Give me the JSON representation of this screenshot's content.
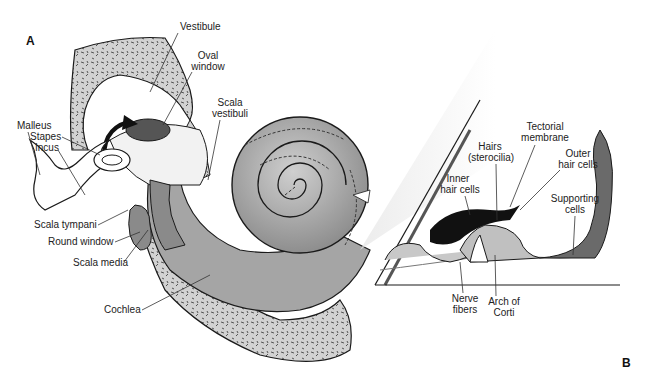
{
  "figure": {
    "panels": {
      "a": "A",
      "b": "B"
    },
    "labels_a": {
      "vestibule": "Vestibule",
      "oval_window_1": "Oval",
      "oval_window_2": "window",
      "scala_vestibuli_1": "Scala",
      "scala_vestibuli_2": "vestibuli",
      "malleus": "Malleus",
      "stapes": "Stapes",
      "incus": "Incus",
      "scala_tympani": "Scala tympani",
      "round_window": "Round window",
      "scala_media": "Scala media",
      "cochlea": "Cochlea"
    },
    "labels_b": {
      "tectorial_1": "Tectorial",
      "tectorial_2": "membrane",
      "hairs_1": "Hairs",
      "hairs_2": "(sterocilia)",
      "outer_1": "Outer",
      "outer_2": "hair cells",
      "inner_1": "Inner",
      "inner_2": "hair cells",
      "supporting_1": "Supporting",
      "supporting_2": "cells",
      "nerve_1": "Nerve",
      "nerve_2": "fibers",
      "arch_1": "Arch of",
      "arch_2": "Corti"
    },
    "colors": {
      "bone_fill": "#d2d2d2",
      "cochlea_fill": "#a8a8a8",
      "oval_window": "#555555",
      "tectorial": "#111111",
      "outline": "#1a1a1a"
    }
  }
}
